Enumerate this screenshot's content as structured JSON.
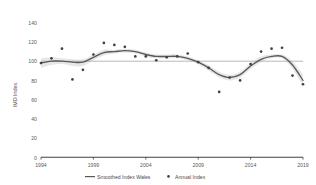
{
  "chart_data": {
    "type": "line",
    "title": "",
    "xlabel": "",
    "ylabel": "IMD Index",
    "xlim": [
      1994,
      2019
    ],
    "ylim": [
      0,
      140
    ],
    "grid": false,
    "legend_position": "bottom",
    "x_ticks": [
      "1994",
      "1999",
      "2004",
      "2009",
      "2014",
      "2019"
    ],
    "y_ticks": [
      "0",
      "20",
      "40",
      "60",
      "80",
      "100",
      "120",
      "140"
    ],
    "reference_line": 100,
    "x": [
      1994,
      1995,
      1996,
      1997,
      1998,
      1999,
      2000,
      2001,
      2002,
      2003,
      2004,
      2005,
      2006,
      2007,
      2008,
      2009,
      2010,
      2011,
      2012,
      2013,
      2014,
      2015,
      2016,
      2017,
      2018,
      2019
    ],
    "series": [
      {
        "name": "Annual Index",
        "type": "scatter",
        "values": [
          98,
          103,
          113,
          81,
          91,
          107,
          119,
          117,
          115,
          105,
          105,
          101,
          104,
          105,
          108,
          99,
          93,
          68,
          83,
          80,
          97,
          110,
          113,
          114,
          85,
          76
        ]
      },
      {
        "name": "Smoothed Index Wales",
        "type": "line",
        "values": [
          98,
          100,
          100,
          99,
          99,
          104,
          109,
          110,
          111,
          110,
          107,
          105,
          105,
          105,
          103,
          99,
          93,
          86,
          83,
          86,
          95,
          102,
          105,
          105,
          96,
          80
        ]
      }
    ],
    "confidence_band": {
      "upper": [
        103,
        104,
        103,
        102,
        102,
        107,
        112,
        112,
        113,
        112,
        109,
        107,
        107,
        107,
        105,
        101,
        96,
        89,
        86,
        89,
        98,
        105,
        107,
        107,
        100,
        86
      ],
      "lower": [
        93,
        96,
        97,
        95,
        95,
        101,
        106,
        108,
        109,
        108,
        105,
        103,
        103,
        103,
        101,
        97,
        90,
        83,
        80,
        83,
        92,
        99,
        103,
        103,
        92,
        74
      ]
    }
  },
  "legend": {
    "items": [
      {
        "label": "Smoothed Index Wales",
        "marker": "line",
        "color": "#595959"
      },
      {
        "label": "Annual Index",
        "marker": "dot",
        "color": "#404040"
      }
    ]
  },
  "colors": {
    "line": "#595959",
    "band": "#d9d9d9",
    "marker": "#404040",
    "axis": "#404040",
    "reference": "#a6a6a6",
    "tick_text": "#5a5a5a"
  }
}
